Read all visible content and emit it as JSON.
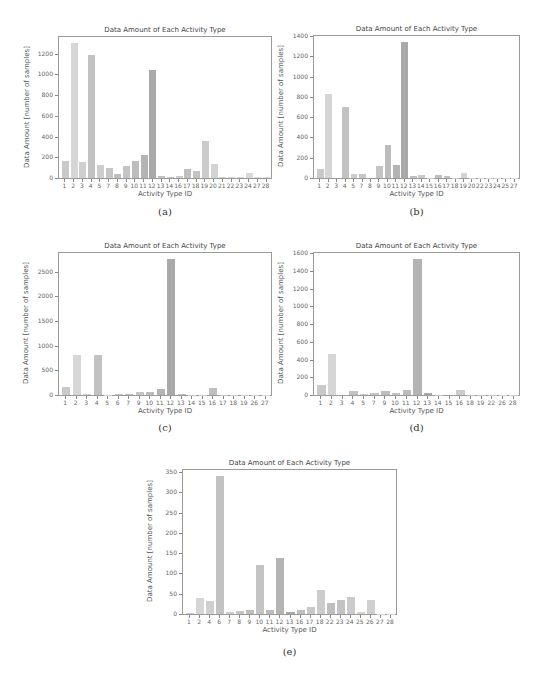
{
  "chart_data": [
    {
      "id": "a",
      "caption": "(a)",
      "type": "bar",
      "title": "Data Amount of Each Activity Type",
      "xlabel": "Activity Type ID",
      "ylabel": "Data Amount [number of samples]",
      "ylim": [
        0,
        1360
      ],
      "yticks": [
        0,
        200,
        400,
        600,
        800,
        1000,
        1200
      ],
      "categories": [
        "1",
        "2",
        "3",
        "4",
        "5",
        "7",
        "8",
        "9",
        "10",
        "11",
        "12",
        "13",
        "14",
        "16",
        "17",
        "18",
        "19",
        "20",
        "21",
        "22",
        "23",
        "24",
        "27",
        "28"
      ],
      "values": [
        165,
        1300,
        150,
        1190,
        130,
        100,
        40,
        115,
        165,
        225,
        1040,
        15,
        5,
        15,
        85,
        65,
        355,
        140,
        5,
        10,
        10,
        45,
        5,
        5
      ],
      "grid": false,
      "legend": null
    },
    {
      "id": "b",
      "caption": "(b)",
      "type": "bar",
      "title": "Data Amount of Each Activity Type",
      "xlabel": "Activity Type ID",
      "ylabel": "Data Amount [number of samples]",
      "ylim": [
        0,
        1400
      ],
      "yticks": [
        0,
        200,
        400,
        600,
        800,
        1000,
        1200,
        1400
      ],
      "categories": [
        "1",
        "2",
        "3",
        "4",
        "5",
        "7",
        "8",
        "9",
        "10",
        "11",
        "12",
        "13",
        "14",
        "15",
        "16",
        "17",
        "18",
        "19",
        "20",
        "22",
        "23",
        "24",
        "25",
        "27"
      ],
      "values": [
        85,
        825,
        0,
        700,
        35,
        35,
        0,
        115,
        330,
        130,
        1340,
        15,
        25,
        5,
        30,
        15,
        5,
        45,
        3,
        3,
        3,
        3,
        3,
        3
      ],
      "grid": false,
      "legend": null
    },
    {
      "id": "c",
      "caption": "(c)",
      "type": "bar",
      "title": "Data Amount of Each Activity Type",
      "xlabel": "Activity Type ID",
      "ylabel": "Data Amount [number of samples]",
      "ylim": [
        0,
        2880
      ],
      "yticks": [
        0,
        500,
        1000,
        1500,
        2000,
        2500
      ],
      "categories": [
        "1",
        "2",
        "3",
        "4",
        "5",
        "6",
        "7",
        "9",
        "10",
        "11",
        "12",
        "13",
        "14",
        "15",
        "16",
        "17",
        "18",
        "19",
        "26",
        "27"
      ],
      "values": [
        160,
        810,
        30,
        820,
        10,
        15,
        20,
        60,
        55,
        115,
        2750,
        20,
        5,
        5,
        140,
        10,
        5,
        5,
        5,
        5
      ],
      "grid": false,
      "legend": null
    },
    {
      "id": "d",
      "caption": "(d)",
      "type": "bar",
      "title": "Data Amount of Each Activity Type",
      "xlabel": "Activity Type ID",
      "ylabel": "Data Amount [number of samples]",
      "ylim": [
        0,
        1600
      ],
      "yticks": [
        0,
        200,
        400,
        600,
        800,
        1000,
        1200,
        1400,
        1600
      ],
      "categories": [
        "1",
        "2",
        "3",
        "4",
        "5",
        "7",
        "9",
        "10",
        "11",
        "12",
        "13",
        "14",
        "15",
        "16",
        "18",
        "19",
        "22",
        "26",
        "28"
      ],
      "values": [
        115,
        465,
        0,
        50,
        10,
        20,
        40,
        20,
        60,
        1530,
        20,
        3,
        0,
        55,
        3,
        3,
        3,
        3,
        3
      ],
      "grid": false,
      "legend": null
    },
    {
      "id": "e",
      "caption": "(e)",
      "type": "bar",
      "title": "Data Amount of Each Activity Type",
      "xlabel": "Activity Type ID",
      "ylabel": "Data Amount [number of samples]",
      "ylim": [
        0,
        355
      ],
      "yticks": [
        0,
        50,
        100,
        150,
        200,
        250,
        300,
        350
      ],
      "categories": [
        "1",
        "2",
        "4",
        "6",
        "7",
        "8",
        "9",
        "10",
        "11",
        "12",
        "13",
        "16",
        "17",
        "18",
        "22",
        "23",
        "24",
        "25",
        "26",
        "27",
        "28"
      ],
      "values": [
        2,
        40,
        33,
        340,
        5,
        7,
        9,
        122,
        10,
        138,
        5,
        10,
        17,
        58,
        28,
        35,
        41,
        5,
        35,
        1,
        1
      ],
      "grid": false,
      "legend": null
    }
  ],
  "layout": [
    {
      "id": "a",
      "plot": {
        "left": 58,
        "top": 36,
        "width": 214,
        "height": 143
      },
      "caption_y": 212
    },
    {
      "id": "b",
      "plot": {
        "left": 313,
        "top": 35,
        "width": 207,
        "height": 144
      },
      "caption_y": 212
    },
    {
      "id": "c",
      "plot": {
        "left": 58,
        "top": 252,
        "width": 214,
        "height": 144
      },
      "caption_y": 428
    },
    {
      "id": "d",
      "plot": {
        "left": 313,
        "top": 252,
        "width": 207,
        "height": 144
      },
      "caption_y": 428
    },
    {
      "id": "e",
      "plot": {
        "left": 182,
        "top": 469,
        "width": 215,
        "height": 146
      },
      "caption_y": 652
    }
  ],
  "bar_colors": [
    "#c9c9c9",
    "#d6d6d6",
    "#cfcfcf",
    "#c2c2c2",
    "#cdcdcd",
    "#c6c6c6",
    "#bebebe",
    "#c4c4c4",
    "#bcbcbc",
    "#b4b4b4",
    "#a9a9a9",
    "#c0c0c0",
    "#c8c8c8",
    "#cccccc",
    "#bfbfbf",
    "#c3c3c3",
    "#cbcbcb",
    "#d3d3d3",
    "#d0d0d0",
    "#d8d8d8",
    "#d4d4d4",
    "#d9d9d9",
    "#dadada",
    "#dcdcdc"
  ]
}
